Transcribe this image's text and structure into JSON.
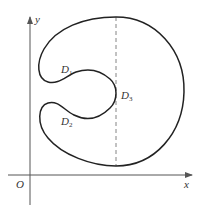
{
  "figure": {
    "axes": {
      "x_label": "x",
      "y_label": "y",
      "origin_label": "O"
    },
    "regions": [
      {
        "name": "D",
        "sub": "1"
      },
      {
        "name": "D",
        "sub": "2"
      },
      {
        "name": "D",
        "sub": "3"
      }
    ],
    "colors": {
      "curve": "#222222",
      "axis": "#555555",
      "dashed": "#777777"
    }
  }
}
